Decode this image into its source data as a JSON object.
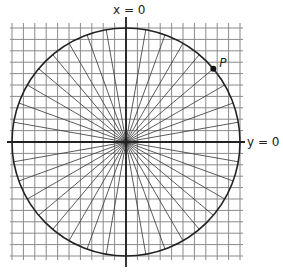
{
  "diagram": {
    "labels": {
      "vertical_axis": "x = 0",
      "horizontal_axis": "y = 0",
      "point": "P"
    },
    "geometry": {
      "center": [
        126,
        142
      ],
      "radius": 114,
      "grid_spacing": 11.4,
      "grid_extent": {
        "left": 12,
        "right": 241,
        "top": 17,
        "bottom": 260
      },
      "spoke_count": 36,
      "spoke_step_deg": 10,
      "point_angle_deg": 40
    },
    "colors": {
      "grid": "#8a8a8a",
      "lines": "#333333",
      "circle": "#222222",
      "point": "#111111"
    }
  }
}
